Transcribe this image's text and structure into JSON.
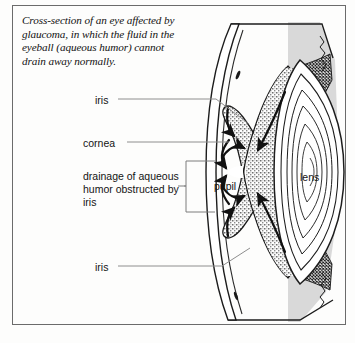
{
  "figure": {
    "caption": "Cross-section of an eye affected by glaucoma, in which the fluid in the eyeball (aqueous humor) cannot drain away normally.",
    "border_color": "#6b6b6b",
    "background_color": "#fdfdfc"
  },
  "labels": {
    "iris_top": "iris",
    "cornea": "cornea",
    "drainage": "drainage of aqueous humor obstructed by iris",
    "iris_bottom": "iris",
    "pupil": "pupil",
    "lens": "lens"
  },
  "diagram": {
    "structures": [
      "sclera-outline",
      "cornea",
      "anterior-chamber",
      "iris-stippled",
      "pupil-opening",
      "lens-concentric",
      "ciliary-body",
      "zonule-fibers-hatched",
      "posterior-chamber-shaded"
    ],
    "flow_arrows": [
      "aqueous-flow-upper-inward",
      "aqueous-flow-lower-inward",
      "aqueous-flow-pupil-upper",
      "aqueous-flow-pupil-lower",
      "aqueous-blocked-upper",
      "aqueous-blocked-lower"
    ],
    "colors": {
      "ink": "#1a1a1a",
      "stipple_gray": "#b9b9b9",
      "shade_gray": "#d8d8d8",
      "leader_line": "#8c8c8c"
    }
  }
}
